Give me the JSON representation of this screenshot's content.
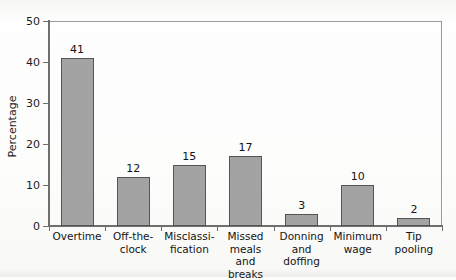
{
  "chart_data": {
    "type": "bar",
    "title": "",
    "xlabel": "",
    "ylabel": "Percentage",
    "ylim": [
      0,
      50
    ],
    "yticks": [
      0,
      10,
      20,
      30,
      40,
      50
    ],
    "grid": false,
    "legend": "none",
    "categories": [
      "Overtime",
      "Off-the-\nclock",
      "Misclassi-\nfication",
      "Missed\nmeals\nand breaks",
      "Donning\nand\ndoffing",
      "Minimum\nwage",
      "Tip\npooling"
    ],
    "values": [
      41,
      12,
      15,
      17,
      3,
      10,
      2
    ],
    "value_labels": [
      "41",
      "12",
      "15",
      "17",
      "3",
      "10",
      "2"
    ],
    "bar_color": "#a3a3a3",
    "bar_border_color": "#555555",
    "axis_color": "#6f6f6f",
    "background_color": "#fdfdfc"
  },
  "axes": {
    "y_title": "Percentage",
    "y_tick_labels": [
      "50",
      "40",
      "30",
      "20",
      "10",
      "0"
    ]
  },
  "page": {
    "cut_top_text": ""
  }
}
